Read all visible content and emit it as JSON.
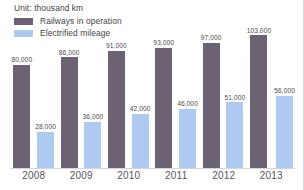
{
  "chart_data": {
    "type": "bar",
    "title": "",
    "subtitle": "",
    "unit_label": "Unit: thousand km",
    "xlabel": "",
    "ylabel": "",
    "categories": [
      "2008",
      "2009",
      "2010",
      "2011",
      "2012",
      "2013"
    ],
    "ylim": [
      0,
      110000
    ],
    "grid": false,
    "legend_position": "top-left",
    "series": [
      {
        "name": "Railways in operation",
        "color": "#6d6273",
        "values": [
          80000,
          86000,
          91000,
          93000,
          97000,
          103000
        ],
        "labels": [
          "80,000",
          "86,000",
          "91,000",
          "93,000",
          "97,000",
          "103,000"
        ]
      },
      {
        "name": "Electrified mileage",
        "color": "#aecaf0",
        "values": [
          28000,
          36000,
          42000,
          46000,
          51000,
          56000
        ],
        "labels": [
          "28,000",
          "36,000",
          "42,000",
          "46,000",
          "51,000",
          "56,000"
        ]
      }
    ]
  },
  "colors": {
    "series_dark": "#6d6273",
    "series_light": "#aecaf0",
    "text": "#3f3f46",
    "axis": "#d5d5dc",
    "background": "#ffffff"
  }
}
